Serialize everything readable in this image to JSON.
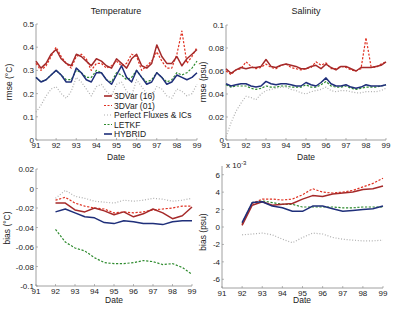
{
  "chart_data": [
    {
      "id": "tl",
      "type": "line",
      "title": "Temperature",
      "xlabel": "Date",
      "ylabel": "rmse (°C)",
      "xlim": [
        91,
        99
      ],
      "ylim": [
        0,
        0.5
      ],
      "xticks": [
        "91",
        "92",
        "93",
        "94",
        "95",
        "96",
        "97",
        "98",
        "99"
      ],
      "yticks": [
        "0",
        "0.1",
        "0.2",
        "0.3",
        "0.4",
        "0.5"
      ],
      "ytick_values": [
        0,
        0.1,
        0.2,
        0.3,
        0.4,
        0.5
      ],
      "grid": false,
      "legend_position": "lower right (inside)",
      "x": [
        91.0,
        91.25,
        91.5,
        91.75,
        92.0,
        92.25,
        92.5,
        92.75,
        93.0,
        93.25,
        93.5,
        93.75,
        94.0,
        94.25,
        94.5,
        94.75,
        95.0,
        95.25,
        95.5,
        95.75,
        96.0,
        96.25,
        96.5,
        96.75,
        97.0,
        97.25,
        97.5,
        97.75,
        98.0,
        98.25,
        98.5,
        98.75,
        99.0
      ],
      "series": [
        {
          "name": "3DVar  (16)",
          "color": "#a52a2a",
          "style": "solid",
          "values": [
            0.34,
            0.31,
            0.33,
            0.37,
            0.39,
            0.35,
            0.33,
            0.32,
            0.37,
            0.36,
            0.34,
            0.32,
            0.35,
            0.34,
            0.32,
            0.31,
            0.35,
            0.33,
            0.31,
            0.35,
            0.37,
            0.32,
            0.31,
            0.33,
            0.41,
            0.36,
            0.33,
            0.33,
            0.36,
            0.32,
            0.35,
            0.37,
            0.39
          ]
        },
        {
          "name": "3DVar  (01)",
          "color": "#e03020",
          "style": "dashed",
          "values": [
            0.33,
            0.3,
            0.32,
            0.36,
            0.4,
            0.36,
            0.33,
            0.31,
            0.36,
            0.37,
            0.35,
            0.3,
            0.33,
            0.33,
            0.31,
            0.32,
            0.34,
            0.32,
            0.33,
            0.37,
            0.36,
            0.3,
            0.32,
            0.34,
            0.38,
            0.34,
            0.31,
            0.31,
            0.37,
            0.47,
            0.33,
            0.36,
            0.4
          ]
        },
        {
          "name": "Perfect Fluxes & ICs",
          "color": "#b0b0b0",
          "style": "dotted",
          "values": [
            0.12,
            0.15,
            0.19,
            0.22,
            0.23,
            0.2,
            0.18,
            0.21,
            0.27,
            0.25,
            0.22,
            0.19,
            0.23,
            0.24,
            0.21,
            0.19,
            0.24,
            0.25,
            0.21,
            0.19,
            0.26,
            0.23,
            0.2,
            0.19,
            0.23,
            0.22,
            0.19,
            0.18,
            0.22,
            0.21,
            0.19,
            0.2,
            0.24
          ]
        },
        {
          "name": "LETKF",
          "color": "#2e8b2e",
          "style": "dashed",
          "values": [
            0.27,
            0.25,
            0.26,
            0.28,
            0.3,
            0.28,
            0.26,
            0.26,
            0.3,
            0.29,
            0.27,
            0.27,
            0.3,
            0.29,
            0.26,
            0.25,
            0.29,
            0.28,
            0.26,
            0.27,
            0.3,
            0.27,
            0.25,
            0.26,
            0.29,
            0.27,
            0.25,
            0.26,
            0.29,
            0.28,
            0.29,
            0.31,
            0.34
          ]
        },
        {
          "name": "HYBRID",
          "color": "#1f2f7a",
          "style": "solid",
          "values": [
            0.27,
            0.25,
            0.26,
            0.28,
            0.3,
            0.28,
            0.25,
            0.25,
            0.31,
            0.29,
            0.26,
            0.25,
            0.29,
            0.29,
            0.26,
            0.24,
            0.28,
            0.32,
            0.27,
            0.25,
            0.3,
            0.27,
            0.24,
            0.25,
            0.29,
            0.27,
            0.24,
            0.25,
            0.28,
            0.27,
            0.26,
            0.27,
            0.29
          ]
        }
      ]
    },
    {
      "id": "tr",
      "type": "line",
      "title": "Salinity",
      "xlabel": "Date",
      "ylabel": "rmse (psu)",
      "xlim": [
        91,
        99
      ],
      "ylim": [
        0,
        0.1
      ],
      "xticks": [
        "91",
        "92",
        "93",
        "94",
        "95",
        "96",
        "97",
        "98",
        "99"
      ],
      "yticks": [
        "0",
        "0.02",
        "0.04",
        "0.06",
        "0.08",
        "0.1"
      ],
      "ytick_values": [
        0,
        0.02,
        0.04,
        0.06,
        0.08,
        0.1
      ],
      "grid": false,
      "x": [
        91.0,
        91.25,
        91.5,
        91.75,
        92.0,
        92.25,
        92.5,
        92.75,
        93.0,
        93.25,
        93.5,
        93.75,
        94.0,
        94.25,
        94.5,
        94.75,
        95.0,
        95.25,
        95.5,
        95.75,
        96.0,
        96.25,
        96.5,
        96.75,
        97.0,
        97.25,
        97.5,
        97.75,
        98.0,
        98.25,
        98.5,
        98.75,
        99.0
      ],
      "series": [
        {
          "name": "3DVar  (16)",
          "color": "#a52a2a",
          "style": "solid",
          "values": [
            0.062,
            0.058,
            0.061,
            0.063,
            0.062,
            0.063,
            0.063,
            0.064,
            0.07,
            0.064,
            0.063,
            0.065,
            0.066,
            0.065,
            0.064,
            0.062,
            0.062,
            0.064,
            0.065,
            0.062,
            0.066,
            0.063,
            0.061,
            0.064,
            0.064,
            0.062,
            0.06,
            0.063,
            0.063,
            0.063,
            0.064,
            0.065,
            0.068
          ]
        },
        {
          "name": "3DVar  (01)",
          "color": "#e03020",
          "style": "dashed",
          "values": [
            0.06,
            0.057,
            0.061,
            0.062,
            0.068,
            0.064,
            0.062,
            0.063,
            0.066,
            0.063,
            0.062,
            0.065,
            0.066,
            0.063,
            0.062,
            0.061,
            0.062,
            0.063,
            0.068,
            0.065,
            0.067,
            0.062,
            0.062,
            0.064,
            0.063,
            0.061,
            0.06,
            0.062,
            0.089,
            0.064,
            0.063,
            0.066,
            0.068
          ]
        },
        {
          "name": "Perfect Fluxes & ICs",
          "color": "#b0b0b0",
          "style": "dotted",
          "values": [
            0.003,
            0.015,
            0.025,
            0.032,
            0.038,
            0.037,
            0.035,
            0.04,
            0.043,
            0.044,
            0.045,
            0.046,
            0.046,
            0.044,
            0.043,
            0.041,
            0.04,
            0.042,
            0.043,
            0.044,
            0.046,
            0.043,
            0.042,
            0.043,
            0.043,
            0.042,
            0.041,
            0.041,
            0.042,
            0.042,
            0.042,
            0.043,
            0.045
          ]
        },
        {
          "name": "LETKF",
          "color": "#2e8b2e",
          "style": "dashed",
          "values": [
            0.048,
            0.046,
            0.047,
            0.047,
            0.047,
            0.045,
            0.044,
            0.045,
            0.047,
            0.046,
            0.046,
            0.047,
            0.047,
            0.046,
            0.046,
            0.046,
            0.048,
            0.046,
            0.046,
            0.048,
            0.051,
            0.047,
            0.046,
            0.046,
            0.047,
            0.045,
            0.044,
            0.045,
            0.046,
            0.046,
            0.046,
            0.047,
            0.048
          ]
        },
        {
          "name": "HYBRID",
          "color": "#1f2f7a",
          "style": "solid",
          "values": [
            0.049,
            0.047,
            0.048,
            0.049,
            0.049,
            0.047,
            0.046,
            0.047,
            0.051,
            0.049,
            0.048,
            0.049,
            0.049,
            0.048,
            0.047,
            0.047,
            0.05,
            0.048,
            0.047,
            0.05,
            0.054,
            0.049,
            0.047,
            0.047,
            0.048,
            0.046,
            0.045,
            0.046,
            0.048,
            0.047,
            0.047,
            0.047,
            0.048
          ]
        }
      ]
    },
    {
      "id": "bl",
      "type": "line",
      "title": "",
      "xlabel": "Date",
      "ylabel": "bias (°C)",
      "xlim": [
        91,
        99
      ],
      "ylim": [
        -0.1,
        0.02
      ],
      "xticks": [
        "91",
        "92",
        "93",
        "94",
        "95",
        "96",
        "97",
        "98",
        "99"
      ],
      "yticks": [
        "0.02",
        "0",
        "-0.02",
        "-0.04",
        "-0.06",
        "-0.08",
        "-0.1"
      ],
      "ytick_values": [
        0.02,
        0,
        -0.02,
        -0.04,
        -0.06,
        -0.08,
        -0.1
      ],
      "grid": false,
      "x": [
        92.0,
        92.5,
        93.0,
        93.5,
        94.0,
        94.5,
        95.0,
        95.5,
        96.0,
        96.5,
        97.0,
        97.5,
        98.0,
        98.5,
        99.0
      ],
      "series": [
        {
          "name": "3DVar  (16)",
          "color": "#a52a2a",
          "style": "solid",
          "values": [
            -0.015,
            -0.015,
            -0.022,
            -0.024,
            -0.02,
            -0.023,
            -0.027,
            -0.024,
            -0.029,
            -0.026,
            -0.021,
            -0.025,
            -0.031,
            -0.028,
            -0.019
          ]
        },
        {
          "name": "3DVar  (01)",
          "color": "#e03020",
          "style": "dashed",
          "values": [
            -0.012,
            -0.009,
            -0.015,
            -0.018,
            -0.02,
            -0.021,
            -0.025,
            -0.024,
            -0.025,
            -0.024,
            -0.022,
            -0.021,
            -0.02,
            -0.018,
            -0.018
          ]
        },
        {
          "name": "Perfect Fluxes & ICs",
          "color": "#b0b0b0",
          "style": "dotted",
          "values": [
            -0.01,
            -0.002,
            -0.008,
            -0.01,
            -0.013,
            -0.014,
            -0.015,
            -0.012,
            -0.013,
            -0.012,
            -0.01,
            -0.011,
            -0.013,
            -0.012,
            -0.01
          ]
        },
        {
          "name": "LETKF",
          "color": "#2e8b2e",
          "style": "dashed",
          "values": [
            -0.042,
            -0.055,
            -0.061,
            -0.064,
            -0.071,
            -0.076,
            -0.077,
            -0.077,
            -0.076,
            -0.074,
            -0.075,
            -0.078,
            -0.077,
            -0.081,
            -0.088
          ]
        },
        {
          "name": "HYBRID",
          "color": "#1f2f7a",
          "style": "solid",
          "values": [
            -0.024,
            -0.021,
            -0.025,
            -0.029,
            -0.03,
            -0.035,
            -0.036,
            -0.033,
            -0.034,
            -0.036,
            -0.036,
            -0.037,
            -0.034,
            -0.033,
            -0.033
          ]
        }
      ]
    },
    {
      "id": "br",
      "type": "line",
      "title": "",
      "xlabel": "Date",
      "ylabel": "bias (psu)",
      "scale_label": "x 10",
      "scale_exponent": "-3",
      "xlim": [
        91,
        99
      ],
      "ylim": [
        -7,
        7
      ],
      "xticks": [
        "91",
        "92",
        "93",
        "94",
        "95",
        "96",
        "97",
        "98",
        "99"
      ],
      "yticks": [
        "6",
        "4",
        "2",
        "0",
        "-2",
        "-4",
        "-6"
      ],
      "ytick_values": [
        6,
        4,
        2,
        0,
        -2,
        -4,
        -6
      ],
      "grid": false,
      "x": [
        92.0,
        92.5,
        93.0,
        93.5,
        94.0,
        94.5,
        95.0,
        95.5,
        96.0,
        96.5,
        97.0,
        97.5,
        98.0,
        98.5,
        99.0
      ],
      "series": [
        {
          "name": "3DVar  (16)",
          "color": "#a52a2a",
          "style": "solid",
          "values": [
            0.2,
            2.5,
            2.9,
            2.5,
            2.6,
            2.7,
            3.2,
            3.6,
            3.5,
            3.8,
            3.9,
            4.0,
            4.3,
            4.4,
            4.7
          ]
        },
        {
          "name": "3DVar  (01)",
          "color": "#e03020",
          "style": "dashed",
          "values": [
            0.3,
            2.7,
            3.2,
            3.2,
            3.1,
            3.2,
            3.7,
            4.4,
            4.0,
            3.9,
            4.0,
            4.2,
            4.6,
            5.0,
            5.6
          ]
        },
        {
          "name": "Perfect Fluxes & ICs",
          "color": "#b0b0b0",
          "style": "dotted",
          "values": [
            -0.9,
            -0.8,
            -0.7,
            -0.9,
            -1.4,
            -1.8,
            -1.2,
            -0.7,
            -0.8,
            -1.2,
            -1.4,
            -1.5,
            -1.6,
            -1.6,
            -1.5
          ]
        },
        {
          "name": "LETKF",
          "color": "#2e8b2e",
          "style": "dashed",
          "values": [
            0.4,
            2.8,
            3.0,
            2.8,
            2.6,
            2.6,
            2.3,
            2.3,
            2.3,
            2.3,
            2.2,
            2.2,
            2.3,
            2.3,
            2.3
          ]
        },
        {
          "name": "HYBRID",
          "color": "#1f2f7a",
          "style": "solid",
          "values": [
            0.5,
            2.8,
            2.9,
            2.4,
            2.2,
            1.8,
            1.8,
            2.4,
            2.4,
            2.1,
            1.8,
            1.9,
            2.0,
            2.1,
            2.4
          ]
        }
      ]
    }
  ],
  "legend": {
    "items": [
      {
        "label": "3DVar  (16)",
        "color": "#a52a2a",
        "style": "solid"
      },
      {
        "label": "3DVar  (01)",
        "color": "#e03020",
        "style": "dashed"
      },
      {
        "label": "Perfect Fluxes & ICs",
        "color": "#b0b0b0",
        "style": "dotted"
      },
      {
        "label": "LETKF",
        "color": "#2e8b2e",
        "style": "dashed"
      },
      {
        "label": "HYBRID",
        "color": "#1f2f7a",
        "style": "solid"
      }
    ]
  }
}
